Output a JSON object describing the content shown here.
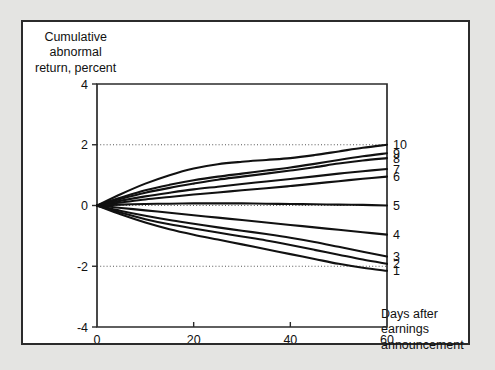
{
  "figure": {
    "background_color": "#e4e4e2",
    "panel_color": "#ffffff",
    "frame_color": "#2b2b2b",
    "line_color": "#111111"
  },
  "labels": {
    "y_axis_title": "Cumulative\nabnormal\nreturn, percent",
    "x_axis_title": "Days after\nearnings\nannouncement"
  },
  "chart_data": {
    "type": "line",
    "title": "",
    "xlabel": "Days after earnings announcement",
    "ylabel": "Cumulative abnormal return, percent",
    "xlim": [
      0,
      60
    ],
    "ylim": [
      -4,
      4
    ],
    "xticks": [
      0,
      20,
      40,
      60
    ],
    "yticks": [
      -4,
      -2,
      0,
      2,
      4
    ],
    "xtick_labels": [
      "0",
      "20",
      "40",
      "60"
    ],
    "ytick_labels": [
      "-4",
      "-2",
      "0",
      "2",
      "4"
    ],
    "grid": "horizontal dotted at -2, 0, 2",
    "legend": "series number annotated at right end of each curve",
    "x": [
      0,
      5,
      10,
      15,
      20,
      25,
      30,
      35,
      40,
      45,
      50,
      55,
      60
    ],
    "series": [
      {
        "name": "10",
        "label": "10",
        "values": [
          0,
          0.38,
          0.72,
          1.0,
          1.22,
          1.36,
          1.44,
          1.5,
          1.56,
          1.66,
          1.78,
          1.9,
          2.0
        ]
      },
      {
        "name": "9",
        "label": "9",
        "values": [
          0,
          0.26,
          0.5,
          0.68,
          0.83,
          0.95,
          1.05,
          1.15,
          1.25,
          1.37,
          1.5,
          1.62,
          1.72
        ]
      },
      {
        "name": "8",
        "label": "8",
        "values": [
          0,
          0.22,
          0.42,
          0.58,
          0.72,
          0.85,
          0.95,
          1.05,
          1.15,
          1.26,
          1.38,
          1.48,
          1.56
        ]
      },
      {
        "name": "7",
        "label": "7",
        "values": [
          0,
          0.16,
          0.3,
          0.42,
          0.53,
          0.62,
          0.71,
          0.79,
          0.87,
          0.96,
          1.05,
          1.13,
          1.2
        ]
      },
      {
        "name": "6",
        "label": "6",
        "values": [
          0,
          0.1,
          0.2,
          0.28,
          0.36,
          0.43,
          0.5,
          0.57,
          0.64,
          0.72,
          0.8,
          0.88,
          0.95
        ]
      },
      {
        "name": "5",
        "label": "5",
        "values": [
          0,
          0.03,
          0.05,
          0.06,
          0.07,
          0.07,
          0.07,
          0.06,
          0.05,
          0.04,
          0.03,
          0.02,
          0.0
        ]
      },
      {
        "name": "4",
        "label": "4",
        "values": [
          0,
          -0.08,
          -0.16,
          -0.24,
          -0.32,
          -0.4,
          -0.48,
          -0.56,
          -0.64,
          -0.72,
          -0.8,
          -0.88,
          -0.96
        ]
      },
      {
        "name": "3",
        "label": "3",
        "values": [
          0,
          -0.18,
          -0.34,
          -0.48,
          -0.6,
          -0.72,
          -0.83,
          -0.94,
          -1.06,
          -1.2,
          -1.36,
          -1.52,
          -1.68
        ]
      },
      {
        "name": "2",
        "label": "2",
        "values": [
          0,
          -0.24,
          -0.45,
          -0.62,
          -0.76,
          -0.89,
          -1.02,
          -1.15,
          -1.3,
          -1.46,
          -1.62,
          -1.78,
          -1.92
        ]
      },
      {
        "name": "1",
        "label": "1",
        "values": [
          0,
          -0.3,
          -0.56,
          -0.78,
          -0.96,
          -1.12,
          -1.28,
          -1.44,
          -1.6,
          -1.76,
          -1.92,
          -2.05,
          -2.15
        ]
      }
    ]
  }
}
